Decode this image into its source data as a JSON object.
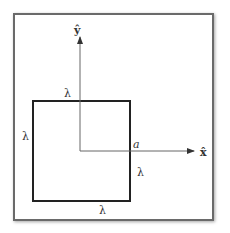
{
  "diagram": {
    "axes": {
      "y_label": "ŷ",
      "x_label": "x̂"
    },
    "labels": {
      "top": "λ",
      "left": "λ",
      "right": "λ",
      "bottom": "λ",
      "a": "a"
    },
    "colors": {
      "square": "#222222",
      "axis": "#555555",
      "frame": "#6a6a6a"
    }
  }
}
